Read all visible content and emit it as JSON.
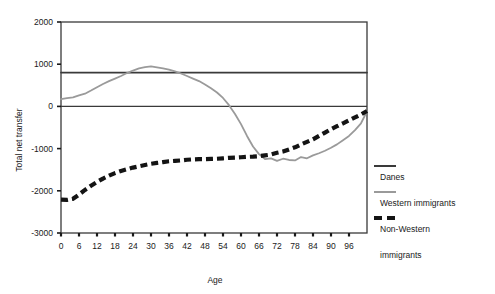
{
  "chart_data": {
    "type": "line",
    "title": "",
    "xlabel": "Age",
    "ylabel": "Total net transfer",
    "xlim": [
      0,
      102
    ],
    "ylim": [
      -3000,
      2000
    ],
    "grid": false,
    "legend_position": "right",
    "xticks": [
      0,
      6,
      12,
      18,
      24,
      30,
      36,
      42,
      48,
      54,
      60,
      66,
      72,
      78,
      84,
      90,
      96
    ],
    "xtick_labels": [
      "0",
      "6",
      "12",
      "18",
      "24",
      "30",
      "36",
      "42",
      "48",
      "54",
      "60",
      "66",
      "72",
      "78",
      "84",
      "90",
      "96"
    ],
    "yticks": [
      2000,
      1000,
      0,
      -1000,
      -2000,
      -3000
    ],
    "ytick_labels": [
      "2000",
      "1000",
      "0",
      "-1000",
      "-2000",
      "-3000"
    ],
    "series": [
      {
        "name": "Danes",
        "color": "#3a3a3a",
        "style": "solid",
        "width": 1.6,
        "x": [
          0,
          102
        ],
        "values": [
          800,
          800
        ]
      },
      {
        "name": "Western immigrants",
        "color": "#9a9a9a",
        "style": "solid",
        "width": 1.8,
        "x": [
          0,
          2,
          4,
          6,
          8,
          10,
          12,
          14,
          16,
          18,
          20,
          22,
          24,
          26,
          28,
          30,
          32,
          34,
          36,
          38,
          40,
          42,
          44,
          46,
          48,
          50,
          52,
          54,
          56,
          58,
          60,
          62,
          64,
          66,
          68,
          70,
          72,
          74,
          76,
          78,
          80,
          82,
          84,
          86,
          88,
          90,
          92,
          94,
          96,
          98,
          100,
          102
        ],
        "values": [
          170,
          195,
          215,
          260,
          300,
          375,
          455,
          530,
          600,
          660,
          720,
          790,
          850,
          900,
          930,
          950,
          925,
          900,
          870,
          830,
          780,
          720,
          660,
          600,
          520,
          430,
          330,
          200,
          30,
          -180,
          -420,
          -700,
          -950,
          -1130,
          -1250,
          -1230,
          -1290,
          -1240,
          -1270,
          -1280,
          -1200,
          -1230,
          -1160,
          -1110,
          -1050,
          -980,
          -900,
          -800,
          -700,
          -560,
          -400,
          -120
        ]
      },
      {
        "name": "Non-Western immigrants",
        "color": "#141414",
        "style": "dashed",
        "width": 4.2,
        "x": [
          0,
          2,
          4,
          6,
          8,
          10,
          12,
          14,
          16,
          18,
          20,
          22,
          24,
          26,
          28,
          30,
          32,
          34,
          36,
          38,
          40,
          42,
          44,
          46,
          48,
          50,
          52,
          54,
          56,
          58,
          60,
          62,
          64,
          66,
          68,
          70,
          72,
          74,
          76,
          78,
          80,
          82,
          84,
          86,
          88,
          90,
          92,
          94,
          96,
          98,
          100,
          102
        ],
        "values": [
          -2210,
          -2215,
          -2190,
          -2090,
          -1980,
          -1880,
          -1790,
          -1710,
          -1640,
          -1580,
          -1530,
          -1490,
          -1450,
          -1420,
          -1390,
          -1360,
          -1340,
          -1320,
          -1300,
          -1290,
          -1280,
          -1265,
          -1255,
          -1250,
          -1250,
          -1245,
          -1240,
          -1230,
          -1220,
          -1215,
          -1205,
          -1195,
          -1190,
          -1180,
          -1160,
          -1140,
          -1100,
          -1070,
          -1020,
          -970,
          -900,
          -840,
          -780,
          -700,
          -620,
          -540,
          -470,
          -400,
          -330,
          -260,
          -190,
          -110
        ]
      }
    ],
    "reference_lines": [
      {
        "name": "zero-line",
        "value": 0,
        "color": "#3a3a3a"
      }
    ]
  },
  "legend": {
    "entries": [
      {
        "label": "Danes",
        "swatch": "solid-dark"
      },
      {
        "label": "Western immigrants",
        "swatch": "solid-gray"
      },
      {
        "label": "Non-Western",
        "swatch": "dashed-black"
      },
      {
        "label": "immigrants",
        "swatch": "none"
      }
    ]
  }
}
